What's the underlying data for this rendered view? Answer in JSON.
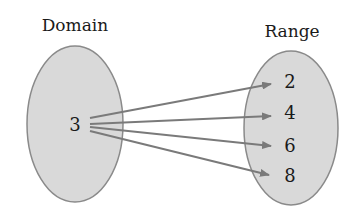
{
  "diagram": {
    "type": "mapping-diagram",
    "domain": {
      "title": "Domain",
      "elements": [
        "3"
      ],
      "fill": "#d9d9d9",
      "stroke": "#8a8a8a"
    },
    "range": {
      "title": "Range",
      "elements": [
        "2",
        "4",
        "6",
        "8"
      ],
      "fill": "#d9d9d9",
      "stroke": "#8a8a8a"
    },
    "arrows": [
      {
        "from": "3",
        "to": "2"
      },
      {
        "from": "3",
        "to": "4"
      },
      {
        "from": "3",
        "to": "6"
      },
      {
        "from": "3",
        "to": "8"
      }
    ],
    "arrow_color": "#7a7a7a"
  }
}
